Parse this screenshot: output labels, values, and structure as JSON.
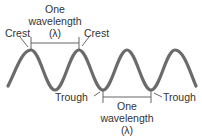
{
  "diagram": {
    "type": "wave",
    "colors": {
      "wave": "#6b6b6b",
      "annotation": "#555555",
      "text": "#333333",
      "background": "#ffffff"
    },
    "labels": {
      "crest_left": "Crest",
      "crest_right": "Crest",
      "trough_left": "Trough",
      "trough_right": "Trough",
      "top_wavelength": {
        "line1": "One",
        "line2": "wavelength",
        "line3": "(λ)"
      },
      "bottom_wavelength": {
        "line1": "One",
        "line2": "wavelength",
        "line3": "(λ)"
      }
    },
    "wave": {
      "crests_x": [
        31,
        79,
        127,
        175
      ],
      "troughs_x": [
        55,
        103,
        151
      ],
      "crest_y": 50,
      "trough_y": 90,
      "start": [
        8,
        86
      ],
      "end": [
        196,
        86
      ]
    }
  }
}
